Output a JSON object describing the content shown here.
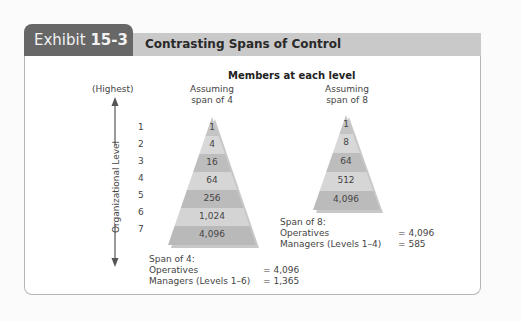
{
  "header": {
    "exhibit_prefix": "Exhibit ",
    "exhibit_number": "15-3",
    "title": "Contrasting Spans of Control"
  },
  "diagram": {
    "members_title": "Members at each level",
    "axis": {
      "top_label": "(Highest)",
      "label": "Organizational Level",
      "levels": [
        "1",
        "2",
        "3",
        "4",
        "5",
        "6",
        "7"
      ]
    },
    "pyramid_span4": {
      "caption_line1": "Assuming",
      "caption_line2": "span of 4",
      "values": [
        "1",
        "4",
        "16",
        "64",
        "256",
        "1,024",
        "4,096"
      ],
      "summary": {
        "heading": "Span of 4:",
        "operatives_label": "Operatives",
        "operatives_value": "= 4,096",
        "managers_label": "Managers (Levels 1–6)",
        "managers_value": "= 1,365"
      }
    },
    "pyramid_span8": {
      "caption_line1": "Assuming",
      "caption_line2": "span of 8",
      "values": [
        "1",
        "8",
        "64",
        "512",
        "4,096"
      ],
      "summary": {
        "heading": "Span of 8:",
        "operatives_label": "Operatives",
        "operatives_value": "= 4,096",
        "managers_label": "Managers (Levels 1–4)",
        "managers_value": "= 585"
      }
    },
    "colors": {
      "tab_bg": "#676767",
      "header_bg": "#c9c9c9",
      "band_dark": "#b9b9b9",
      "band_light": "#d6d6d6",
      "shadow": "#8e8e8e"
    }
  }
}
